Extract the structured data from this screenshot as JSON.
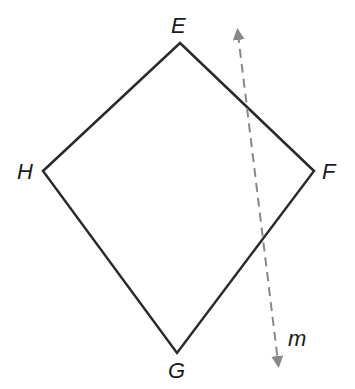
{
  "diagram": {
    "vertices": [
      {
        "name": "E",
        "x": 180,
        "y": 43
      },
      {
        "name": "F",
        "x": 314,
        "y": 171
      },
      {
        "name": "G",
        "x": 177,
        "y": 353
      },
      {
        "name": "H",
        "x": 43,
        "y": 171
      }
    ],
    "labels": {
      "E": "E",
      "F": "F",
      "G": "G",
      "H": "H",
      "m": "m"
    },
    "line_m": {
      "x1": 238,
      "y1": 28,
      "x2": 278,
      "y2": 368,
      "style": "dashed",
      "arrows": "both"
    },
    "colors": {
      "shape": "#2a2a2a",
      "line": "#888888"
    }
  }
}
